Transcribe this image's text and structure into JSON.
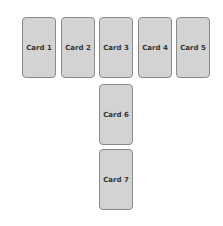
{
  "diagram": {
    "background": "#ffffff",
    "card_fill": "#d3d3d3",
    "card_border": "#8a8a8a",
    "cards": [
      {
        "label": "Card 1",
        "x": 22,
        "y": 17
      },
      {
        "label": "Card 2",
        "x": 61,
        "y": 17
      },
      {
        "label": "Card 3",
        "x": 99,
        "y": 17
      },
      {
        "label": "Card 4",
        "x": 138,
        "y": 17
      },
      {
        "label": "Card 5",
        "x": 176,
        "y": 17
      },
      {
        "label": "Card 6",
        "x": 99,
        "y": 84
      },
      {
        "label": "Card 7",
        "x": 99,
        "y": 149
      }
    ]
  }
}
